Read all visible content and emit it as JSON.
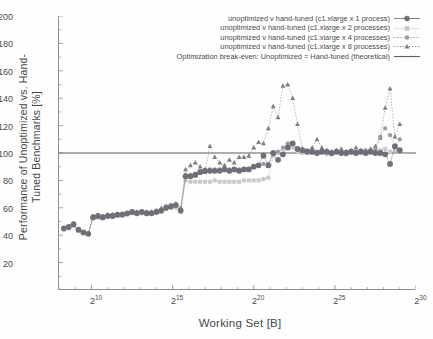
{
  "chart": {
    "ylabel": "Performance of Unoptimized vs. Hand-Tuned Benchmarks [%]",
    "xlabel": "Working Set [B]"
  },
  "yticks": [
    {
      "label": "200"
    },
    {
      "label": "180"
    },
    {
      "label": "160"
    },
    {
      "label": "140"
    },
    {
      "label": "120"
    },
    {
      "label": "100"
    },
    {
      "label": "80"
    },
    {
      "label": "60"
    },
    {
      "label": "40"
    },
    {
      "label": "20"
    }
  ],
  "xticks": [
    {
      "base": "2",
      "exp": "10"
    },
    {
      "base": "2",
      "exp": "15"
    },
    {
      "base": "2",
      "exp": "20"
    },
    {
      "base": "2",
      "exp": "25"
    },
    {
      "base": "2",
      "exp": "30"
    }
  ],
  "legend": [
    {
      "label": "unoptimized v hand-tuned (c1.xlarge x 1 process)",
      "key": "circle-solid-dark"
    },
    {
      "label": "unoptimized v hand-tuned (c1.xlarge x 2 processes)",
      "key": "square-light"
    },
    {
      "label": "unoptimized v hand-tuned (c1.xlarge x 4 processes)",
      "key": "circle-dotted-mid"
    },
    {
      "label": "unoptimized v hand-tuned (c1.xlarge x 8 processes)",
      "key": "triangle-dotted-dark"
    },
    {
      "label": "Optimization break-even: Unoptimized = Hand-tuned (theoretical)",
      "key": "line-solid"
    }
  ],
  "colors": {
    "p1": "#6f6f77",
    "p2": "#c9c9cb",
    "p4": "#9a9aa0",
    "p8": "#7d7d84",
    "breakeven": "#5d5d5d",
    "axis": "#8e8e8e",
    "text": "#4a4a4a"
  },
  "chart_data": {
    "type": "scatter",
    "title": "",
    "xlabel": "Working Set [B]",
    "ylabel": "Performance of Unoptimized vs. Hand-Tuned Benchmarks [%]",
    "xscale": "log2",
    "xlim": [
      256,
      1073741824
    ],
    "xlim_log2": [
      8,
      30
    ],
    "ylim": [
      0,
      200
    ],
    "yticks": [
      20,
      40,
      60,
      80,
      100,
      120,
      140,
      160,
      180,
      200
    ],
    "xtick_log2": [
      10,
      15,
      20,
      25,
      30
    ],
    "xtick_labels": [
      "2^10",
      "2^15",
      "2^20",
      "2^25",
      "2^30"
    ],
    "grid": false,
    "legend_position": "top-right",
    "annotations": [
      {
        "type": "hline",
        "y": 100,
        "label": "Optimization break-even: Unoptimized = Hand-tuned (theoretical)"
      }
    ],
    "x_log2": [
      8.3,
      8.6,
      8.9,
      9.2,
      9.5,
      9.8,
      10.1,
      10.4,
      10.7,
      11.0,
      11.3,
      11.6,
      11.9,
      12.2,
      12.5,
      12.8,
      13.1,
      13.4,
      13.7,
      14.0,
      14.3,
      14.6,
      14.9,
      15.2,
      15.5,
      15.8,
      16.1,
      16.4,
      16.7,
      17.0,
      17.3,
      17.6,
      17.9,
      18.2,
      18.5,
      18.8,
      19.1,
      19.4,
      19.7,
      20.0,
      20.3,
      20.6,
      20.9,
      21.2,
      21.5,
      21.8,
      22.1,
      22.4,
      22.7,
      23.0,
      23.3,
      23.6,
      23.9,
      24.2,
      24.5,
      24.8,
      25.1,
      25.4,
      25.7,
      26.0,
      26.3,
      26.6,
      26.9,
      27.2,
      27.5,
      27.8,
      28.1,
      28.4,
      28.7,
      29.0
    ],
    "series": [
      {
        "name": "unoptimized v hand-tuned (c1.xlarge x 1 process)",
        "marker": "circle",
        "style": "solid-large",
        "color": "#6f6f77",
        "values": [
          45,
          46,
          48,
          44,
          42,
          41,
          53,
          54,
          53,
          54,
          54,
          55,
          55,
          56,
          57,
          56,
          57,
          56,
          56,
          57,
          58,
          60,
          61,
          62,
          58,
          83,
          83,
          84,
          86,
          87,
          87,
          87,
          87,
          88,
          87,
          88,
          87,
          88,
          88,
          90,
          91,
          98,
          91,
          100,
          95,
          99,
          104,
          107,
          103,
          102,
          101,
          101,
          100,
          101,
          101,
          100,
          101,
          100,
          100,
          101,
          100,
          101,
          100,
          101,
          100,
          100,
          99,
          92,
          105,
          102
        ]
      },
      {
        "name": "unoptimized v hand-tuned (c1.xlarge x 2 processes)",
        "marker": "square",
        "style": "light",
        "color": "#c9c9cb",
        "values": [
          44,
          45,
          47,
          43,
          42,
          41,
          53,
          53,
          53,
          54,
          54,
          54,
          55,
          55,
          56,
          56,
          56,
          56,
          56,
          57,
          57,
          59,
          60,
          60,
          57,
          80,
          79,
          79,
          79,
          79,
          79,
          80,
          79,
          79,
          79,
          79,
          79,
          80,
          80,
          80,
          80,
          81,
          82,
          98,
          100,
          103,
          106,
          104,
          101,
          100,
          100,
          100,
          100,
          100,
          99,
          99,
          100,
          100,
          99,
          100,
          100,
          100,
          100,
          100,
          101,
          102,
          103,
          101,
          102,
          102
        ]
      },
      {
        "name": "unoptimized v hand-tuned (c1.xlarge x 4 processes)",
        "marker": "circle",
        "style": "dotted",
        "color": "#9a9aa0",
        "values": [
          45,
          46,
          48,
          44,
          42,
          41,
          54,
          54,
          54,
          54,
          55,
          55,
          55,
          56,
          57,
          57,
          57,
          57,
          57,
          58,
          59,
          61,
          62,
          62,
          59,
          84,
          84,
          85,
          87,
          88,
          88,
          88,
          88,
          88,
          88,
          88,
          88,
          88,
          88,
          90,
          91,
          92,
          92,
          99,
          101,
          104,
          107,
          107,
          103,
          102,
          102,
          101,
          101,
          101,
          101,
          100,
          101,
          100,
          101,
          101,
          101,
          102,
          102,
          102,
          103,
          112,
          118,
          113,
          104,
          110
        ]
      },
      {
        "name": "unoptimized v hand-tuned (c1.xlarge x 8 processes)",
        "marker": "triangle",
        "style": "dotted",
        "color": "#7d7d84",
        "values": [
          45,
          46,
          48,
          44,
          42,
          41,
          54,
          54,
          54,
          55,
          55,
          55,
          56,
          56,
          57,
          57,
          57,
          57,
          57,
          58,
          60,
          61,
          62,
          63,
          60,
          88,
          91,
          93,
          90,
          86,
          105,
          97,
          93,
          91,
          95,
          93,
          97,
          97,
          98,
          104,
          108,
          107,
          118,
          134,
          126,
          149,
          150,
          140,
          121,
          103,
          102,
          104,
          110,
          104,
          102,
          101,
          102,
          103,
          101,
          102,
          104,
          102,
          102,
          103,
          105,
          111,
          133,
          147,
          112,
          121
        ]
      }
    ]
  }
}
